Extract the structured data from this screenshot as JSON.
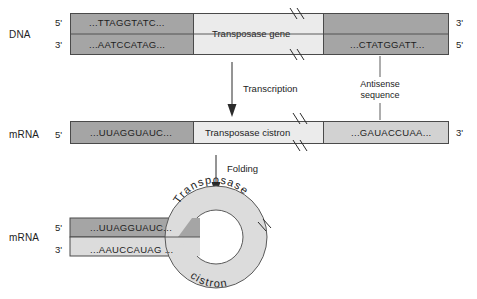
{
  "figure": {
    "rows": [
      {
        "id": "dna-row",
        "molecule_label": "DNA",
        "left_prime_top": "5'",
        "left_prime_bottom": "3'",
        "right_prime_top": "3'",
        "right_prime_bottom": "5'",
        "segments": [
          {
            "name": "dna-left-flank",
            "shade": "dark",
            "top_sequence": "...TTAGGTATC...",
            "bottom_sequence": "...AATCCATAG..."
          },
          {
            "name": "dna-gene",
            "shade": "light",
            "label": "Transposase gene"
          },
          {
            "name": "dna-right-flank",
            "shade": "dark",
            "sequence": "...CTATGGATT..."
          }
        ]
      },
      {
        "id": "mrna-row",
        "molecule_label": "mRNA",
        "left_prime": "5'",
        "right_prime": "3'",
        "segments": [
          {
            "name": "mrna-left-flank",
            "shade": "dark",
            "sequence": "...UUAGGUAUC..."
          },
          {
            "name": "mrna-cistron",
            "shade": "light",
            "label": "Transposase cistron"
          },
          {
            "name": "mrna-right-flank",
            "shade": "mid",
            "sequence": "...GAUACCUAA..."
          }
        ]
      },
      {
        "id": "folded-row",
        "molecule_label": "mRNA",
        "left_prime_top": "5'",
        "left_prime_bottom": "3'",
        "top_strand_sequence": "...UUAGGUAUC...",
        "bottom_strand_sequence": "...AAUCCAUAG ...",
        "loop_label_top": "Transposase",
        "loop_label_bottom": "cistron"
      }
    ],
    "arrows": [
      {
        "name": "transcription-arrow",
        "label": "Transcription"
      },
      {
        "name": "folding-arrow",
        "label": "Folding"
      }
    ],
    "callouts": [
      {
        "name": "antisense-callout",
        "line1": "Antisense",
        "line2": "sequence"
      }
    ],
    "colors": {
      "dark_gray": "#a5a5a5",
      "mid_gray": "#d2d2d2",
      "light_gray": "#ebebeb",
      "ring_gray": "#dcdcdc",
      "stroke": "#4a4a4a",
      "text": "#1d1d1d"
    }
  }
}
